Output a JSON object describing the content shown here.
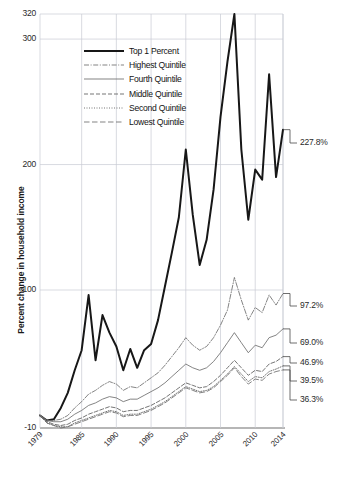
{
  "chart_data": {
    "type": "line",
    "title": "",
    "xlabel": "",
    "ylabel": "Percent change in household income",
    "xlim": [
      1979,
      2014
    ],
    "ylim": [
      -10,
      320
    ],
    "grid": true,
    "legend_position": "top-center",
    "y_ticks": [
      {
        "value": 320,
        "label": "320"
      },
      {
        "value": 300,
        "label": "300"
      },
      {
        "value": 200,
        "label": "200"
      },
      {
        "value": 100,
        "label": "100"
      },
      {
        "value": -10,
        "label": "-10"
      }
    ],
    "x_ticks": [
      {
        "value": 1979,
        "label": "1979"
      },
      {
        "value": 1985,
        "label": "1985"
      },
      {
        "value": 1990,
        "label": "1990"
      },
      {
        "value": 1995,
        "label": "1995"
      },
      {
        "value": 2000,
        "label": "2000"
      },
      {
        "value": 2005,
        "label": "2005"
      },
      {
        "value": 2010,
        "label": "2010"
      },
      {
        "value": 2014,
        "label": "2014"
      }
    ],
    "x": [
      1979,
      1980,
      1981,
      1982,
      1983,
      1984,
      1985,
      1986,
      1987,
      1988,
      1989,
      1990,
      1991,
      1992,
      1993,
      1994,
      1995,
      1996,
      1997,
      1998,
      1999,
      2000,
      2001,
      2002,
      2003,
      2004,
      2005,
      2006,
      2007,
      2008,
      2009,
      2010,
      2011,
      2012,
      2013,
      2014
    ],
    "series": [
      {
        "name": "Top 1 Percent",
        "style": "solid-thick",
        "end_label": "227.8%",
        "end_value": 227.8,
        "values": [
          0,
          -4,
          -3,
          6,
          18,
          36,
          52,
          96,
          44,
          80,
          66,
          55,
          36,
          53,
          38,
          52,
          57,
          76,
          103,
          130,
          158,
          212,
          160,
          120,
          140,
          180,
          238,
          282,
          320,
          212,
          156,
          196,
          188,
          272,
          190,
          227.8
        ]
      },
      {
        "name": "Highest Quintile",
        "style": "dash-dot",
        "end_label": "97.2%",
        "end_value": 97.2,
        "values": [
          0,
          -4,
          -4,
          -3,
          0,
          6,
          11,
          17,
          20,
          24,
          27,
          25,
          20,
          23,
          22,
          26,
          30,
          34,
          40,
          47,
          54,
          62,
          56,
          52,
          55,
          62,
          72,
          84,
          110,
          92,
          76,
          86,
          82,
          96,
          88,
          97.2
        ]
      },
      {
        "name": "Fourth Quintile",
        "style": "solid-thin",
        "end_label": "69.0%",
        "end_value": 69.0,
        "values": [
          0,
          -4,
          -5,
          -5,
          -3,
          1,
          4,
          8,
          10,
          13,
          15,
          14,
          11,
          13,
          13,
          16,
          19,
          22,
          26,
          31,
          36,
          41,
          38,
          36,
          38,
          43,
          50,
          58,
          66,
          58,
          50,
          56,
          54,
          62,
          64,
          69.0
        ]
      },
      {
        "name": "Middle Quintile",
        "style": "dashed",
        "end_label": "46.9%",
        "end_value": 46.9,
        "values": [
          0,
          -5,
          -7,
          -8,
          -7,
          -4,
          -2,
          1,
          3,
          5,
          7,
          6,
          3,
          4,
          4,
          6,
          8,
          11,
          14,
          18,
          22,
          26,
          24,
          22,
          23,
          27,
          32,
          38,
          44,
          38,
          32,
          36,
          35,
          41,
          43,
          46.9
        ]
      },
      {
        "name": "Second Quintile",
        "style": "dotted",
        "end_label": "39.5%",
        "end_value": 39.5,
        "values": [
          0,
          -6,
          -8,
          -9,
          -9,
          -6,
          -4,
          -2,
          0,
          2,
          4,
          3,
          0,
          1,
          1,
          3,
          5,
          8,
          11,
          15,
          19,
          23,
          21,
          19,
          20,
          23,
          28,
          33,
          39,
          33,
          27,
          31,
          30,
          35,
          37,
          39.5
        ]
      },
      {
        "name": "Lowest Quintile",
        "style": "long-dash",
        "end_label": "36.3%",
        "end_value": 36.3,
        "values": [
          0,
          -6,
          -8,
          -10,
          -9,
          -7,
          -5,
          -3,
          -1,
          1,
          3,
          2,
          -1,
          0,
          0,
          2,
          4,
          7,
          10,
          14,
          18,
          22,
          20,
          18,
          19,
          22,
          27,
          32,
          38,
          31,
          25,
          29,
          28,
          33,
          35,
          36.3
        ]
      }
    ]
  },
  "legend": {
    "items": [
      {
        "label": "Top 1 Percent"
      },
      {
        "label": "Highest Quintile"
      },
      {
        "label": "Fourth Quintile"
      },
      {
        "label": "Middle Quintile"
      },
      {
        "label": "Second Quintile"
      },
      {
        "label": "Lowest Quintile"
      }
    ]
  },
  "colors": {
    "top1": "#171717",
    "series_gray": "#6e6e6e",
    "grid": "#c8ccd4",
    "axis": "#6e6e6e",
    "text": "#1f1f1f"
  }
}
